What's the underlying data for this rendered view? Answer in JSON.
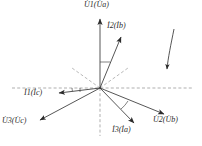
{
  "figure": {
    "type": "phasor-diagram",
    "title": "",
    "origin": {
      "x": 100,
      "y": 88
    },
    "axes": {
      "horizontal_dashed": {
        "x1": 12,
        "y1": 88,
        "x2": 192,
        "y2": 88
      },
      "vertical_dashed": {
        "x1": 100,
        "y1": 88,
        "x2": 100,
        "y2": 136
      },
      "reference_rays": [
        {
          "name": "dashed-ray-upper-left",
          "angle_deg": 145,
          "length": 34
        },
        {
          "name": "dashed-ray-upper-right",
          "angle_deg": 35,
          "length": 34
        }
      ],
      "style": "dashed",
      "color": "#8a8a8a"
    },
    "vectors": [
      {
        "id": "u1",
        "label": "U",
        "sub": "1",
        "paren_label": "U",
        "paren_sub": "a",
        "text": "U̇₁(U̇ₐ)",
        "angle_deg": 90,
        "length": 71,
        "tip": {
          "x": 100,
          "y": 17
        },
        "kind": "voltage"
      },
      {
        "id": "i2",
        "label": "I",
        "sub": "2",
        "paren_label": "I",
        "paren_sub": "b",
        "text": "İ2(İb)",
        "angle_deg": 67,
        "length": 58,
        "tip": {
          "x": 123,
          "y": 35
        },
        "kind": "current"
      },
      {
        "id": "i1",
        "label": "I",
        "sub": "1",
        "paren_label": "I",
        "paren_sub": "c",
        "text": "İ1(İc)",
        "angle_deg": 186,
        "length": 43,
        "tip": {
          "x": 57,
          "y": 93
        },
        "kind": "current"
      },
      {
        "id": "u3",
        "label": "U",
        "sub": "3",
        "paren_label": "U",
        "paren_sub": "c",
        "text": "U̇3(U̇c)",
        "angle_deg": 208,
        "length": 70,
        "tip": {
          "x": 38,
          "y": 121
        },
        "kind": "voltage"
      },
      {
        "id": "i3",
        "label": "I",
        "sub": "3",
        "paren_label": "I",
        "paren_sub": "a",
        "text": "İ3(İa)",
        "angle_deg": 314,
        "length": 52,
        "tip": {
          "x": 136,
          "y": 125
        },
        "kind": "current"
      },
      {
        "id": "u2",
        "label": "U",
        "sub": "2",
        "paren_label": "U",
        "paren_sub": "b",
        "text": "U̇2(U̇b)",
        "angle_deg": 332,
        "length": 70,
        "tip": {
          "x": 166,
          "y": 115
        },
        "kind": "voltage"
      }
    ],
    "angle_arcs": [
      {
        "name": "arc-u1-i2",
        "radius": 26,
        "from_deg": 67,
        "to_deg": 90
      },
      {
        "name": "arc-i1-horizontal",
        "radius": 28,
        "from_deg": 180,
        "to_deg": 186
      },
      {
        "name": "arc-i3-u2",
        "radius": 30,
        "from_deg": 314,
        "to_deg": 332
      }
    ],
    "rotation_arrow": {
      "name": "rotation-direction-arrow",
      "description": "curved arrow indicating phasor rotation direction",
      "start": {
        "x": 174,
        "y": 30
      },
      "end": {
        "x": 167,
        "y": 72
      }
    },
    "labels": [
      {
        "id": "u1",
        "text": "U̇1(U̇a)",
        "x": 86,
        "y": 2,
        "name": "label-u1"
      },
      {
        "id": "i2",
        "text": "İ2(İb)",
        "x": 108,
        "y": 23,
        "name": "label-i2"
      },
      {
        "id": "i1",
        "text": "İ1(İc)",
        "x": 25,
        "y": 90,
        "name": "label-i1"
      },
      {
        "id": "u3",
        "text": "U̇3(U̇c)",
        "x": 3,
        "y": 118,
        "name": "label-u3"
      },
      {
        "id": "i3",
        "text": "İ3(İa)",
        "x": 113,
        "y": 127,
        "name": "label-i3"
      },
      {
        "id": "u2",
        "text": "U̇2(U̇b)",
        "x": 155,
        "y": 117,
        "name": "label-u2"
      }
    ],
    "colors": {
      "vector": "#2b2b2b",
      "dashed": "#8d8d8d",
      "arc": "#4a4a4a",
      "background": "#ffffff"
    }
  }
}
